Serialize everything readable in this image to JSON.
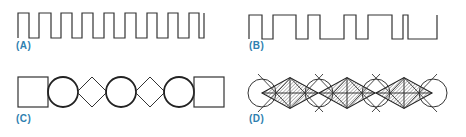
{
  "colors": {
    "line": "#333333",
    "label": "#2f7fb0",
    "hatch": "#555555"
  },
  "panels": [
    {
      "id": "A",
      "label": "(A)",
      "kind": "regular-square-wave",
      "x_start": 18,
      "x_end": 204,
      "y_high": 13,
      "y_low": 38,
      "transitions": [
        18,
        29,
        39,
        51,
        61,
        72,
        82,
        93,
        104,
        114,
        125,
        136,
        147,
        157,
        168,
        178,
        189,
        199,
        204
      ]
    },
    {
      "id": "B",
      "label": "(B)",
      "kind": "irregular-pulse-train",
      "x_start": 249,
      "x_end": 437,
      "y_high": 15,
      "y_low": 39,
      "transitions": [
        249,
        262,
        273,
        296,
        308,
        320,
        344,
        356,
        368,
        392,
        403,
        408,
        437
      ]
    },
    {
      "id": "C",
      "label": "(C)",
      "kind": "shape-chain",
      "shapes": [
        {
          "type": "square",
          "cx": 33,
          "half": 15
        },
        {
          "type": "circle",
          "cx": 63,
          "r": 15
        },
        {
          "type": "diamond",
          "cx": 92,
          "half": 15
        },
        {
          "type": "circle",
          "cx": 121,
          "r": 15
        },
        {
          "type": "diamond",
          "cx": 150,
          "half": 15
        },
        {
          "type": "circle",
          "cx": 179,
          "r": 15
        },
        {
          "type": "square",
          "cx": 209,
          "half": 15
        }
      ],
      "cy": 92
    },
    {
      "id": "D",
      "label": "(D)",
      "kind": "hatched-diamond-chain",
      "circles": [
        262,
        319,
        376,
        433
      ],
      "diamonds": [
        290,
        347,
        404
      ],
      "cy": 93,
      "r": 14,
      "diamond_half": 15
    }
  ]
}
